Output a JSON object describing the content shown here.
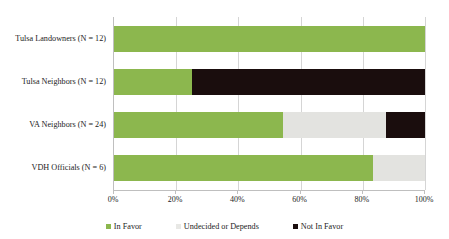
{
  "chart_data": {
    "type": "bar",
    "orientation": "horizontal",
    "stacked": true,
    "stack_mode": "percent",
    "title": "",
    "xlabel": "",
    "ylabel": "",
    "xlim": [
      0,
      100
    ],
    "xtick_labels": [
      "0%",
      "20%",
      "40%",
      "60%",
      "80%",
      "100%"
    ],
    "xticks": [
      0,
      20,
      40,
      60,
      80,
      100
    ],
    "grid": true,
    "grid_axis": "x",
    "legend_position": "bottom",
    "categories": [
      "Tulsa Landowners (N = 12)",
      "Tulsa Neighbors (N = 12)",
      "VA Neighbors (N = 24)",
      "VDH Officials (N = 6)"
    ],
    "series": [
      {
        "name": "In Favor",
        "color": "#8CB74E",
        "values": [
          100,
          25,
          54.2,
          83.3
        ]
      },
      {
        "name": "Undecided or Depends",
        "color": "#E3E3E0",
        "values": [
          0,
          0,
          33.3,
          16.7
        ]
      },
      {
        "name": "Not In Favor",
        "color": "#1A0D0D",
        "values": [
          0,
          75,
          12.5,
          0
        ]
      }
    ]
  },
  "legend": {
    "items": [
      {
        "label": "In Favor",
        "swatch": "favor"
      },
      {
        "label": "Undecided or Depends",
        "swatch": "undecided"
      },
      {
        "label": "Not In Favor",
        "swatch": "against"
      }
    ]
  },
  "colors": {
    "favor": "#8CB74E",
    "undecided": "#E3E3E0",
    "against": "#1A0D0D",
    "gridline": "#D5D5D5",
    "axis": "#BFBFBF",
    "text": "#1C1C1C",
    "background": "#FFFFFF"
  }
}
